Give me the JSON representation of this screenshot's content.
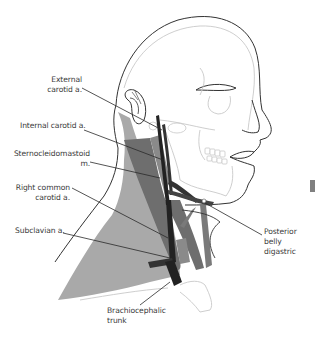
{
  "figure": {
    "colors": {
      "background": "#ffffff",
      "outline_dark": "#333333",
      "outline_light": "#c8c8c8",
      "scm_muscle": "#6e6e6e",
      "trapezius_region": "#a9a9a9",
      "artery_dark": "#222222",
      "leader_line": "#2a2a2a",
      "text": "#3a3a3a"
    },
    "labels": [
      {
        "id": "external-carotid",
        "lines": [
          "External",
          "carotid a."
        ]
      },
      {
        "id": "internal-carotid",
        "lines": [
          "Internal carotid a."
        ]
      },
      {
        "id": "sternocleidomastoid",
        "lines": [
          "Sternocleidomastoid",
          "m."
        ]
      },
      {
        "id": "right-common-carotid",
        "lines": [
          "Right common",
          "carotid a."
        ]
      },
      {
        "id": "subclavian",
        "lines": [
          "Subclavian a."
        ]
      },
      {
        "id": "brachiocephalic",
        "lines": [
          "Brachiocephalic",
          "trunk"
        ]
      },
      {
        "id": "posterior-belly-digastric",
        "lines": [
          "Posterior",
          "belly",
          "digastric"
        ]
      }
    ],
    "edge_marker": {
      "color": "#808080"
    }
  }
}
